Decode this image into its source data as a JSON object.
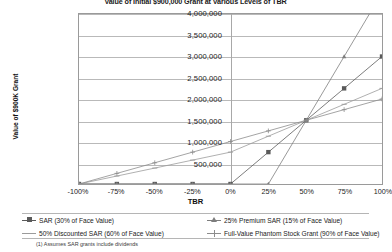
{
  "chart_data": {
    "type": "line",
    "title": "Value of Initial $900,000 Grant at Various Levels of TBR",
    "xlabel": "TBR",
    "ylabel": "Value of $900K Grant",
    "x": [
      -100,
      -75,
      -50,
      -25,
      0,
      25,
      50,
      75,
      100
    ],
    "xtick_labels": [
      "-100%",
      "-75%",
      "-50%",
      "-25%",
      "0%",
      "25%",
      "50%",
      "75%",
      "100%"
    ],
    "ytick_labels": [
      "500,000",
      "1,000,000",
      "1,500,000",
      "2,000,000",
      "2,500,000",
      "3,000,000",
      "3,500,000",
      "4,000,000"
    ],
    "ytick_values": [
      500000,
      1000000,
      1500000,
      2000000,
      2500000,
      3000000,
      3500000,
      4000000
    ],
    "ylim": [
      0,
      4000000
    ],
    "xlim": [
      -100,
      100
    ],
    "grid": true,
    "legend_position": "bottom",
    "series": [
      {
        "name": "SAR (30% of Face Value)",
        "marker": "square",
        "color": "#5a5a5a",
        "values": [
          0,
          0,
          0,
          0,
          0,
          750000,
          1500000,
          2250000,
          3000000
        ]
      },
      {
        "name": "50% Discounted SAR (60% of Face Value)",
        "marker": "dash",
        "color": "#9b9b9b",
        "values": [
          0,
          187500,
          375000,
          562500,
          750000,
          1125000,
          1500000,
          1875000,
          2250000
        ]
      },
      {
        "name": "25% Premium SAR (15% of Face Value)",
        "marker": "triangle",
        "color": "#7d7d7d",
        "values": [
          0,
          0,
          0,
          0,
          0,
          0,
          1500000,
          3000000,
          4500000
        ]
      },
      {
        "name": "Full-Value Phantom Stock Grant (90% of Face Value)",
        "marker": "plus",
        "color": "#8c8c8c",
        "values": [
          0,
          250000,
          500000,
          750000,
          1000000,
          1250000,
          1500000,
          1750000,
          2000000
        ]
      }
    ],
    "footnote": "(1) Assumes SAR grants include dividends"
  }
}
